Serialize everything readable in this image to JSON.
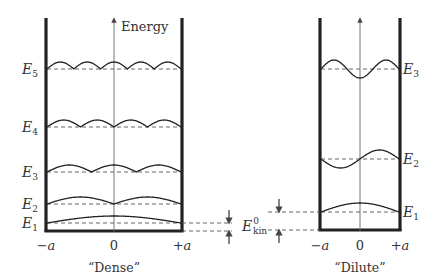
{
  "figure": {
    "axis_label": "Energy",
    "dense": {
      "caption": "“Dense”",
      "x_ticks": [
        "−a",
        "0",
        "+a"
      ],
      "levels": [
        {
          "name": "E",
          "sub": "1",
          "y": 223,
          "mode": 1
        },
        {
          "name": "E",
          "sub": "2",
          "y": 204,
          "mode": 2
        },
        {
          "name": "E",
          "sub": "3",
          "y": 172,
          "mode": 3
        },
        {
          "name": "E",
          "sub": "4",
          "y": 127,
          "mode": 4
        },
        {
          "name": "E",
          "sub": "5",
          "y": 69,
          "mode": 5
        }
      ]
    },
    "dilute": {
      "caption": "“Dilute”",
      "x_ticks": [
        "−a",
        "0",
        "+a"
      ],
      "levels": [
        {
          "name": "E",
          "sub": "1",
          "y": 212,
          "mode": 1
        },
        {
          "name": "E",
          "sub": "2",
          "y": 159,
          "mode": 2
        },
        {
          "name": "E",
          "sub": "3",
          "y": 69,
          "mode": 3
        }
      ]
    },
    "kinetic_label": {
      "name": "E",
      "sup": "0",
      "sub": "kin"
    },
    "colors": {
      "line": "#222222",
      "dash": "#555555",
      "axis": "#666666",
      "text": "#333333"
    }
  }
}
